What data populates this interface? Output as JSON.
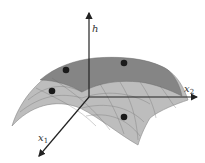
{
  "figure": {
    "type": "3d-surface-diagram",
    "axes": {
      "vertical": {
        "label": "h"
      },
      "right": {
        "label": "x",
        "subscript": "2"
      },
      "front": {
        "label": "x",
        "subscript": "1"
      }
    },
    "points_count": 4,
    "colors": {
      "surface_light": "#b9b9b9",
      "surface_dark": "#7f7f7f",
      "grid": "#6a6a6a",
      "axis": "#222222",
      "point": "#1a1a1a"
    }
  }
}
